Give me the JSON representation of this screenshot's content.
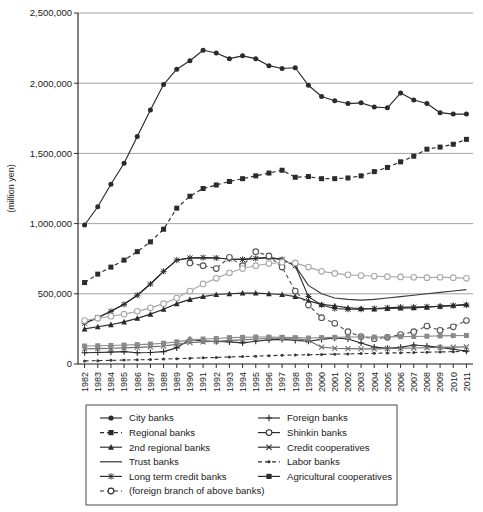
{
  "chart_data": {
    "type": "line",
    "title": "",
    "xlabel": "",
    "ylabel": "(million yen)",
    "ylim": [
      0,
      2500000
    ],
    "xlim": [
      1982,
      2011
    ],
    "grid": true,
    "legend_position": "bottom",
    "ytick_labels": [
      "0",
      "500,000",
      "1,000,000",
      "1,500,000",
      "2,000,000",
      "2,500,000"
    ],
    "ytick_values": [
      0,
      500000,
      1000000,
      1500000,
      2000000,
      2500000
    ],
    "x": [
      1982,
      1983,
      1984,
      1985,
      1986,
      1987,
      1988,
      1989,
      1990,
      1991,
      1992,
      1993,
      1994,
      1995,
      1996,
      1997,
      1998,
      1999,
      2000,
      2001,
      2002,
      2003,
      2004,
      2005,
      2006,
      2007,
      2008,
      2009,
      2010,
      2011
    ],
    "categories": [
      "1982",
      "1983",
      "1984",
      "1985",
      "1986",
      "1987",
      "1988",
      "1989",
      "1990",
      "1991",
      "1992",
      "1993",
      "1994",
      "1995",
      "1996",
      "1997",
      "1998",
      "1999",
      "2000",
      "2001",
      "2002",
      "2003",
      "2004",
      "2005",
      "2006",
      "2007",
      "2008",
      "2009",
      "2010",
      "2011"
    ],
    "series": [
      {
        "name": "City banks",
        "marker": "filled-circle",
        "dash": "solid",
        "color": "#2b2b2b",
        "values": [
          990000,
          1120000,
          1280000,
          1430000,
          1620000,
          1810000,
          1990000,
          2100000,
          2160000,
          2235000,
          2215000,
          2175000,
          2195000,
          2175000,
          2125000,
          2105000,
          2110000,
          1985000,
          1905000,
          1875000,
          1855000,
          1860000,
          1830000,
          1825000,
          1930000,
          1880000,
          1855000,
          1790000,
          1780000,
          1780000
        ]
      },
      {
        "name": "Regional banks",
        "marker": "filled-square",
        "dash": "dashed",
        "color": "#2b2b2b",
        "values": [
          580000,
          640000,
          690000,
          740000,
          800000,
          870000,
          960000,
          1110000,
          1195000,
          1250000,
          1275000,
          1300000,
          1320000,
          1340000,
          1360000,
          1380000,
          1330000,
          1335000,
          1320000,
          1320000,
          1325000,
          1340000,
          1370000,
          1400000,
          1440000,
          1480000,
          1530000,
          1545000,
          1565000,
          1600000
        ]
      },
      {
        "name": "2nd regional banks",
        "marker": "filled-triangle",
        "dash": "solid",
        "color": "#2b2b2b",
        "values": [
          250000,
          265000,
          280000,
          300000,
          325000,
          355000,
          390000,
          430000,
          460000,
          480000,
          495000,
          500000,
          505000,
          505000,
          500000,
          495000,
          480000,
          450000,
          425000,
          415000,
          400000,
          395000,
          392000,
          395000,
          398000,
          400000,
          405000,
          412000,
          418000,
          425000
        ]
      },
      {
        "name": "Trust banks",
        "marker": "none",
        "dash": "solid",
        "color": "#3a3a3a",
        "values": [
          290000,
          330000,
          375000,
          425000,
          490000,
          570000,
          660000,
          740000,
          755000,
          758000,
          755000,
          748000,
          745000,
          752000,
          758000,
          745000,
          700000,
          560000,
          500000,
          470000,
          460000,
          455000,
          460000,
          470000,
          480000,
          490000,
          500000,
          510000,
          520000,
          530000
        ]
      },
      {
        "name": "Long term credit banks",
        "marker": "asterisk",
        "dash": "solid",
        "color": "#2b2b2b",
        "values": [
          290000,
          330000,
          375000,
          425000,
          490000,
          570000,
          660000,
          740000,
          755000,
          758000,
          755000,
          748000,
          745000,
          752000,
          758000,
          745000,
          700000,
          480000,
          420000,
          395000,
          390000,
          390000,
          395000,
          400000,
          405000,
          405000,
          408000,
          410000,
          415000,
          420000
        ]
      },
      {
        "name": "(foreign branch of above banks)",
        "marker": "open-circle",
        "dash": "dashed",
        "color": "#555555",
        "values": [
          null,
          null,
          null,
          null,
          null,
          null,
          null,
          null,
          720000,
          700000,
          680000,
          760000,
          700000,
          800000,
          770000,
          690000,
          520000,
          420000,
          330000,
          290000,
          230000,
          195000,
          180000,
          190000,
          210000,
          230000,
          270000,
          240000,
          265000,
          310000
        ]
      },
      {
        "name": "Foreign banks",
        "marker": "plus",
        "dash": "solid",
        "color": "#2b2b2b",
        "values": [
          80000,
          82000,
          85000,
          88000,
          80000,
          82000,
          88000,
          115000,
          175000,
          165000,
          160000,
          158000,
          150000,
          162000,
          172000,
          175000,
          168000,
          162000,
          175000,
          185000,
          178000,
          150000,
          120000,
          112000,
          118000,
          135000,
          128000,
          118000,
          105000,
          92000
        ]
      },
      {
        "name": "Shinkin banks",
        "marker": "open-circle",
        "dash": "solid",
        "color": "#a8a8a8",
        "values": [
          310000,
          325000,
          340000,
          355000,
          375000,
          400000,
          430000,
          470000,
          520000,
          570000,
          610000,
          650000,
          680000,
          700000,
          715000,
          725000,
          720000,
          690000,
          660000,
          645000,
          635000,
          630000,
          625000,
          622000,
          620000,
          618000,
          615000,
          618000,
          615000,
          610000
        ]
      },
      {
        "name": "Credit cooperatives",
        "marker": "cross",
        "dash": "solid",
        "color": "#6e6e6e",
        "values": [
          108000,
          110000,
          112000,
          115000,
          118000,
          122000,
          128000,
          140000,
          152000,
          158000,
          162000,
          168000,
          172000,
          178000,
          182000,
          185000,
          182000,
          168000,
          120000,
          112000,
          110000,
          108000,
          108000,
          110000,
          112000,
          114000,
          116000,
          118000,
          120000,
          122000
        ]
      },
      {
        "name": "Labor banks",
        "marker": "dot",
        "dash": "dashed",
        "color": "#3a3a3a",
        "values": [
          22000,
          24000,
          26000,
          28000,
          30000,
          32000,
          35000,
          38000,
          41000,
          44000,
          47000,
          50000,
          53000,
          56000,
          59000,
          62000,
          64000,
          66000,
          68000,
          70000,
          72000,
          74000,
          76000,
          78000,
          80000,
          82000,
          84000,
          86000,
          88000,
          90000
        ]
      },
      {
        "name": "Agricultural cooperatives",
        "marker": "filled-square",
        "dash": "solid",
        "color": "#8a8a8a",
        "values": [
          128000,
          130000,
          132000,
          135000,
          138000,
          142000,
          148000,
          158000,
          172000,
          178000,
          182000,
          188000,
          190000,
          192000,
          192000,
          190000,
          188000,
          185000,
          188000,
          190000,
          192000,
          192000,
          192000,
          193000,
          195000,
          196000,
          198000,
          200000,
          202000,
          203000
        ]
      }
    ]
  },
  "legend": {
    "left_column": [
      {
        "label": "City banks",
        "marker": "filled-circle",
        "dash": "solid"
      },
      {
        "label": "Regional banks",
        "marker": "filled-square",
        "dash": "dashed"
      },
      {
        "label": "2nd regional banks",
        "marker": "filled-triangle",
        "dash": "solid"
      },
      {
        "label": "Trust banks",
        "marker": "none",
        "dash": "solid"
      },
      {
        "label": "Long term credit banks",
        "marker": "asterisk",
        "dash": "solid"
      },
      {
        "label": "(foreign branch of above banks)",
        "marker": "open-circle",
        "dash": "dashed"
      }
    ],
    "right_column": [
      {
        "label": "Foreign banks",
        "marker": "plus",
        "dash": "solid"
      },
      {
        "label": "Shinkin banks",
        "marker": "open-circle",
        "dash": "solid"
      },
      {
        "label": "Credit cooperatives",
        "marker": "cross",
        "dash": "solid"
      },
      {
        "label": "Labor banks",
        "marker": "dot",
        "dash": "dashed"
      },
      {
        "label": "Agricultural cooperatives",
        "marker": "filled-square",
        "dash": "solid"
      }
    ]
  }
}
